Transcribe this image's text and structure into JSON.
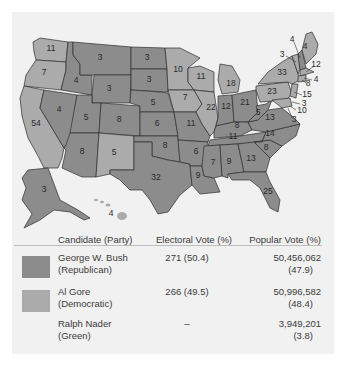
{
  "colors": {
    "republican": "#8c8c8c",
    "democratic": "#ababab",
    "background": "#f1f1f1"
  },
  "map": {
    "states": [
      {
        "id": "WA",
        "ev": "11",
        "party": "D"
      },
      {
        "id": "OR",
        "ev": "7",
        "party": "D"
      },
      {
        "id": "CA",
        "ev": "54",
        "party": "D"
      },
      {
        "id": "ID",
        "ev": "4",
        "party": "R"
      },
      {
        "id": "NV",
        "ev": "4",
        "party": "R"
      },
      {
        "id": "MT",
        "ev": "3",
        "party": "R"
      },
      {
        "id": "WY",
        "ev": "3",
        "party": "R"
      },
      {
        "id": "UT",
        "ev": "5",
        "party": "R"
      },
      {
        "id": "AZ",
        "ev": "8",
        "party": "R"
      },
      {
        "id": "CO",
        "ev": "8",
        "party": "R"
      },
      {
        "id": "NM",
        "ev": "5",
        "party": "D"
      },
      {
        "id": "ND",
        "ev": "3",
        "party": "R"
      },
      {
        "id": "SD",
        "ev": "3",
        "party": "R"
      },
      {
        "id": "NE",
        "ev": "5",
        "party": "R"
      },
      {
        "id": "KS",
        "ev": "6",
        "party": "R"
      },
      {
        "id": "OK",
        "ev": "8",
        "party": "R"
      },
      {
        "id": "TX",
        "ev": "32",
        "party": "R"
      },
      {
        "id": "MN",
        "ev": "10",
        "party": "D"
      },
      {
        "id": "IA",
        "ev": "7",
        "party": "D"
      },
      {
        "id": "MO",
        "ev": "11",
        "party": "R"
      },
      {
        "id": "AR",
        "ev": "6",
        "party": "R"
      },
      {
        "id": "LA",
        "ev": "9",
        "party": "R"
      },
      {
        "id": "WI",
        "ev": "11",
        "party": "D"
      },
      {
        "id": "IL",
        "ev": "22",
        "party": "D"
      },
      {
        "id": "MI",
        "ev": "18",
        "party": "D"
      },
      {
        "id": "IN",
        "ev": "12",
        "party": "R"
      },
      {
        "id": "OH",
        "ev": "21",
        "party": "R"
      },
      {
        "id": "KY",
        "ev": "8",
        "party": "R"
      },
      {
        "id": "TN",
        "ev": "11",
        "party": "R"
      },
      {
        "id": "MS",
        "ev": "7",
        "party": "R"
      },
      {
        "id": "AL",
        "ev": "9",
        "party": "R"
      },
      {
        "id": "GA",
        "ev": "13",
        "party": "R"
      },
      {
        "id": "FL",
        "ev": "25",
        "party": "R"
      },
      {
        "id": "SC",
        "ev": "8",
        "party": "R"
      },
      {
        "id": "NC",
        "ev": "14",
        "party": "R"
      },
      {
        "id": "VA",
        "ev": "13",
        "party": "R"
      },
      {
        "id": "WV",
        "ev": "5",
        "party": "R"
      },
      {
        "id": "PA",
        "ev": "23",
        "party": "D"
      },
      {
        "id": "NY",
        "ev": "33",
        "party": "D"
      },
      {
        "id": "VT",
        "ev": "3",
        "party": "D"
      },
      {
        "id": "NH",
        "ev": "4",
        "party": "R"
      },
      {
        "id": "ME",
        "ev": "4",
        "party": "D"
      },
      {
        "id": "MA",
        "ev": "12",
        "party": "D"
      },
      {
        "id": "RI",
        "ev": "4",
        "party": "D"
      },
      {
        "id": "CT",
        "ev": "8",
        "party": "D"
      },
      {
        "id": "NJ",
        "ev": "15",
        "party": "D"
      },
      {
        "id": "DE",
        "ev": "3",
        "party": "D"
      },
      {
        "id": "MD",
        "ev": "10",
        "party": "D"
      },
      {
        "id": "DC",
        "ev": "3",
        "party": "D"
      },
      {
        "id": "AK",
        "ev": "3",
        "party": "R"
      },
      {
        "id": "HI",
        "ev": "4",
        "party": "D"
      }
    ]
  },
  "table": {
    "headers": {
      "candidate": "Candidate (Party)",
      "electoral": "Electoral Vote (%)",
      "popular": "Popular Vote (%)"
    },
    "rows": [
      {
        "name": "George W. Bush",
        "party": "(Republican)",
        "electoral": "271 (50.4)",
        "popular": "50,456,062",
        "popular_pct": "(47.9)"
      },
      {
        "name": "Al Gore",
        "party": "(Democratic)",
        "electoral": "266 (49.5)",
        "popular": "50,996,582",
        "popular_pct": "(48.4)"
      },
      {
        "name": "Ralph Nader",
        "party": "(Green)",
        "electoral": "–",
        "popular": "3,949,201",
        "popular_pct": "(3.8)"
      }
    ]
  }
}
